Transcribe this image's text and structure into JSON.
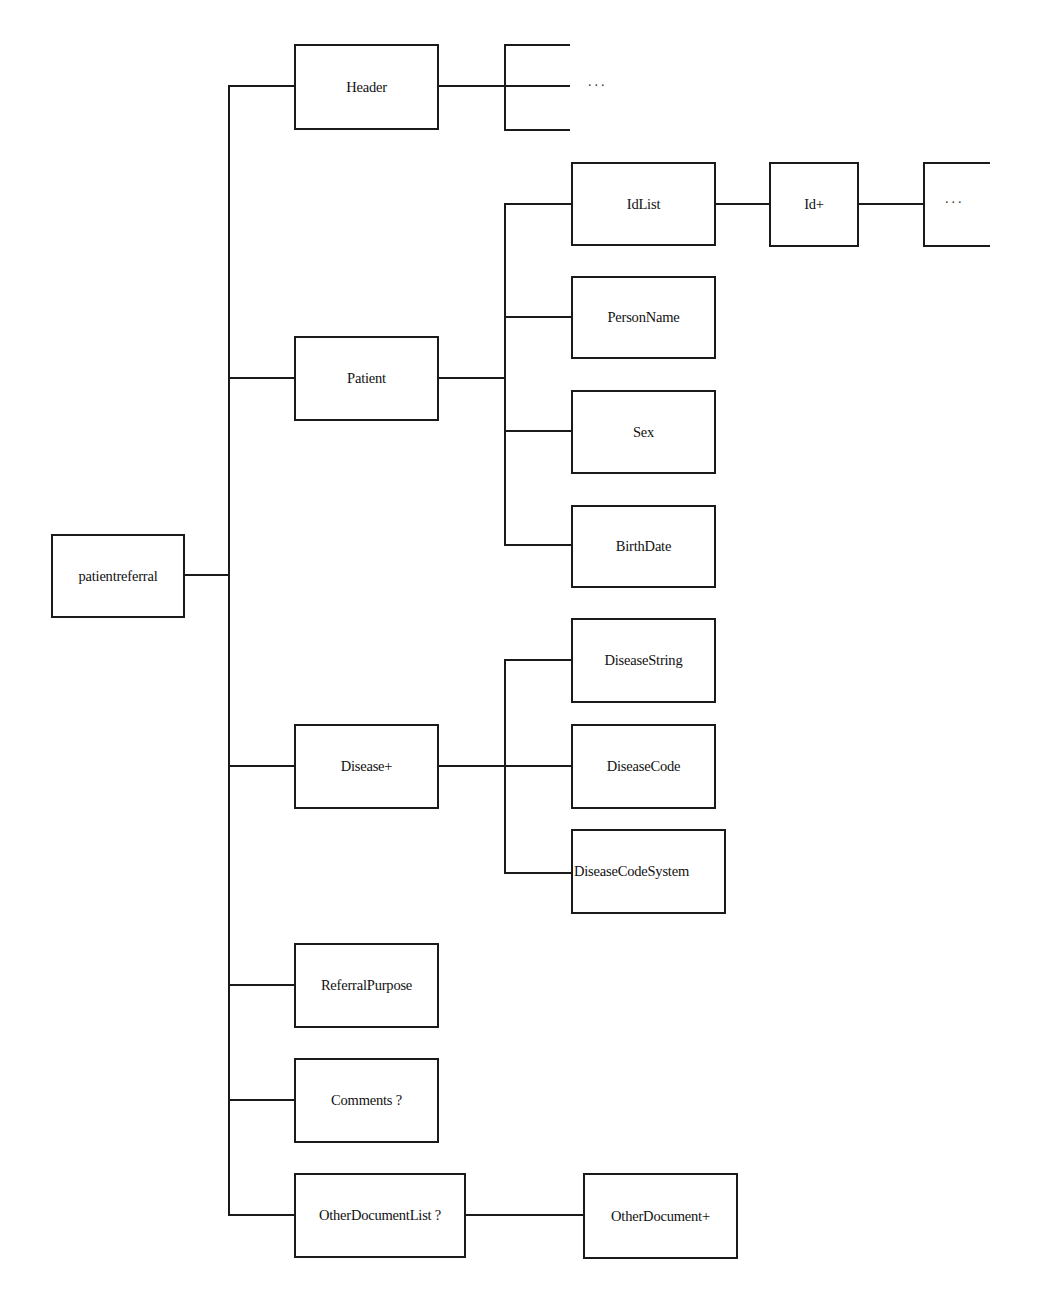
{
  "diagram": {
    "root": {
      "label": "patientreferral"
    },
    "level1": [
      {
        "id": "header",
        "label": "Header"
      },
      {
        "id": "patient",
        "label": "Patient"
      },
      {
        "id": "disease",
        "label": "Disease+"
      },
      {
        "id": "referral_purpose",
        "label": "ReferralPurpose"
      },
      {
        "id": "comments",
        "label": "Comments ?"
      },
      {
        "id": "other_document_list",
        "label": "OtherDocumentList ?"
      }
    ],
    "header_children": {
      "ellipsis": "..."
    },
    "patient_children": [
      {
        "id": "idlist",
        "label": "IdList"
      },
      {
        "id": "person_name",
        "label": "PersonName"
      },
      {
        "id": "sex",
        "label": "Sex"
      },
      {
        "id": "birth_date",
        "label": "BirthDate"
      }
    ],
    "idlist_children": [
      {
        "id": "id",
        "label": "Id+"
      }
    ],
    "id_children": {
      "ellipsis": "..."
    },
    "disease_children": [
      {
        "id": "disease_string",
        "label": "DiseaseString"
      },
      {
        "id": "disease_code",
        "label": "DiseaseCode"
      },
      {
        "id": "disease_code_system",
        "label": "DiseaseCodeSystem"
      }
    ],
    "other_document_list_children": [
      {
        "id": "other_document",
        "label": "OtherDocument+"
      }
    ],
    "colors": {
      "line": "#1a1a1a",
      "box_border": "#1a1a1a",
      "box_fill": "#ffffff",
      "text": "#111111",
      "background": "#ffffff"
    }
  }
}
